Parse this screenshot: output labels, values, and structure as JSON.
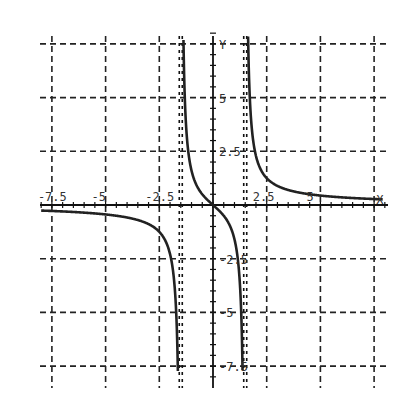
{
  "chart_data": {
    "type": "line",
    "title": "",
    "xlabel": "X",
    "ylabel": "Y",
    "xlim": [
      -8.1,
      8.0
    ],
    "ylim": [
      -8.1,
      7.9
    ],
    "grid": true,
    "grid_style": "dashed",
    "x_ticks": [
      -7.5,
      -5,
      -2.5,
      2.5,
      5,
      7.5
    ],
    "y_ticks": [
      7.5,
      5,
      2.5,
      -2.5,
      -5,
      -7.5
    ],
    "x_tick_labels": [
      "-7.5",
      "-5",
      "-2.5",
      "2.5",
      "5",
      ""
    ],
    "y_tick_labels": [
      "Y",
      "5",
      "2.5",
      "-2.5",
      "-5",
      "-7.5"
    ],
    "asymptotes_x": [
      -1.5,
      1.5
    ],
    "series": [
      {
        "name": "f(x)",
        "description": "rational function with vertical asymptotes at x=±1.5, passes through origin, approaches 0 as |x|→∞",
        "x": [
          -8.0,
          -7.5,
          -5.0,
          -3.0,
          -2.5,
          -2.0,
          -1.8,
          -1.6,
          -1.2,
          -0.8,
          -0.4,
          0,
          0.4,
          0.8,
          1.2,
          1.6,
          1.8,
          2.0,
          2.5,
          3.0,
          5.0,
          7.5,
          8.0
        ],
        "y": [
          -0.26,
          -0.28,
          -0.44,
          -0.89,
          -1.25,
          -2.29,
          -3.6,
          -10.3,
          2.67,
          0.99,
          0.38,
          0,
          -0.38,
          -0.99,
          -2.67,
          10.3,
          3.6,
          2.29,
          1.25,
          0.89,
          0.44,
          0.28,
          0.26
        ]
      }
    ]
  },
  "axis_labels": {
    "x_end": "X",
    "y_top": "Y"
  }
}
